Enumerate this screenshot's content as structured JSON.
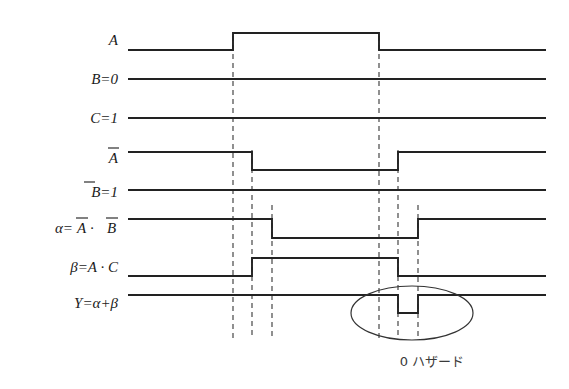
{
  "figure": {
    "width": 569,
    "height": 389,
    "background": "#ffffff",
    "wave_color": "#222222",
    "dash_color": "#555555",
    "text_color": "#1a1a1a"
  },
  "signals": [
    {
      "name": "A",
      "label_main": "A",
      "label_sub": "",
      "overline": "",
      "y_high": 33,
      "y_low": 50,
      "label_y": 45,
      "transitions": [
        {
          "x": 233,
          "to": "high"
        },
        {
          "x": 379,
          "to": "low"
        }
      ],
      "start_level": "low"
    },
    {
      "name": "B",
      "label_main": "B=0",
      "label_sub": "",
      "overline": "",
      "y_high": 63,
      "y_low": 79,
      "label_y": 79,
      "transitions": [],
      "start_level": "low"
    },
    {
      "name": "C",
      "label_main": "C=1",
      "label_sub": "",
      "overline": "",
      "y_high": 112,
      "y_low": 128,
      "label_y": 118,
      "transitions": [],
      "start_level": "high"
    },
    {
      "name": "Abar",
      "label_main": "A",
      "label_sub": "",
      "overline": "A",
      "y_high": 150,
      "y_low": 170,
      "label_y": 162,
      "transitions": [
        {
          "x": 252,
          "to": "low"
        },
        {
          "x": 398,
          "to": "high"
        }
      ],
      "start_level": "high"
    },
    {
      "name": "Bbar",
      "label_main": "B=1",
      "label_sub": "",
      "overline": "B",
      "y_high": 190,
      "y_low": 206,
      "label_y": 196,
      "transitions": [],
      "start_level": "high"
    },
    {
      "name": "alpha",
      "label_main": "α=A · B",
      "label_sub": "",
      "overline": "AB",
      "y_high": 218,
      "y_low": 238,
      "label_y": 230,
      "transitions": [
        {
          "x": 272,
          "to": "low"
        },
        {
          "x": 418,
          "to": "high"
        }
      ],
      "start_level": "high"
    },
    {
      "name": "beta",
      "label_main": "β=A · C",
      "label_sub": "",
      "overline": "",
      "y_high": 256,
      "y_low": 276,
      "label_y": 270,
      "transitions": [
        {
          "x": 252,
          "to": "high"
        },
        {
          "x": 398,
          "to": "low"
        }
      ],
      "start_level": "low"
    },
    {
      "name": "Y",
      "label_main": "Y=α+β",
      "label_sub": "",
      "overline": "",
      "y_high": 292,
      "y_low": 312,
      "label_y": 306,
      "transitions": [
        {
          "x": 398,
          "to": "low"
        },
        {
          "x": 418,
          "to": "high"
        }
      ],
      "start_level": "high"
    }
  ],
  "axis": {
    "wave_start_x": 128,
    "wave_end_x": 546,
    "dash_top_y": 150,
    "dash_bottom_y": 338
  },
  "dashed_lines": [
    {
      "x": 233,
      "y_top": 33,
      "y_bottom": 338
    },
    {
      "x": 252,
      "y_top": 150,
      "y_bottom": 338
    },
    {
      "x": 272,
      "y_top": 205,
      "y_bottom": 338
    },
    {
      "x": 379,
      "y_top": 33,
      "y_bottom": 338
    },
    {
      "x": 398,
      "y_top": 150,
      "y_bottom": 338
    },
    {
      "x": 418,
      "y_top": 205,
      "y_bottom": 338
    }
  ],
  "annotation": {
    "ellipse": {
      "cx": 412,
      "cy": 313,
      "rx": 60,
      "ry": 27
    },
    "caption": "0 ハザード",
    "caption_x": 432,
    "caption_y": 362
  },
  "labels": {
    "A": "A",
    "B": "B=0",
    "C": "C=1",
    "Abar": "A",
    "Bbar": "B=1",
    "alpha_lhs": "α=",
    "alpha_a": "A",
    "alpha_dot": " · ",
    "alpha_b": "B",
    "beta": "β=A · C",
    "Y": "Y=α+β",
    "Bbar_eq": "=1"
  }
}
